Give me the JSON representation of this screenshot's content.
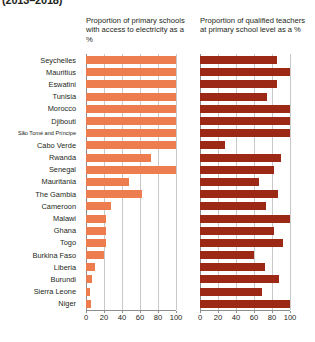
{
  "figure": {
    "title": "(2013–2018)"
  },
  "panels": {
    "left": {
      "header": "Proportion of primary schools with access to electricity as a %"
    },
    "right": {
      "header": "Proportion of qualified teachers at primary school level as a %"
    }
  },
  "axis": {
    "ticks": [
      "0",
      "20",
      "40",
      "60",
      "80",
      "100"
    ]
  },
  "colors": {
    "left_bar": "#ED7D4E",
    "right_bar": "#9B2915",
    "gridline": "#C9C9C9",
    "axis": "#8D8D8D",
    "text": "#231F20",
    "background": "#FFFFFF"
  },
  "chart_data": {
    "type": "bar",
    "orientation": "horizontal",
    "title": "(2013–2018)",
    "xlabel": "",
    "ylabel": "",
    "xlim": [
      0,
      100
    ],
    "grid": true,
    "legend": "none",
    "categories": [
      "Seychelles",
      "Mauritius",
      "Eswatini",
      "Tunisia",
      "Morocco",
      "Djibouti",
      "São Tomé and Príncipe",
      "Cabo Verde",
      "Rwanda",
      "Senegal",
      "Mauritania",
      "The Gambia",
      "Cameroon",
      "Malawi",
      "Ghana",
      "Togo",
      "Burkina Faso",
      "Liberia",
      "Burundi",
      "Sierra Leone",
      "Niger"
    ],
    "series": [
      {
        "name": "Proportion of primary schools with access to electricity as a %",
        "color": "#ED7D4E",
        "values": [
          100,
          100,
          100,
          100,
          100,
          100,
          100,
          100,
          72,
          100,
          48,
          62,
          28,
          22,
          22,
          22,
          20,
          10,
          7,
          4,
          5
        ]
      },
      {
        "name": "Proportion of qualified teachers at primary school level as a %",
        "color": "#9B2915",
        "values": [
          85,
          100,
          86,
          74,
          100,
          100,
          100,
          28,
          90,
          82,
          66,
          87,
          73,
          100,
          82,
          92,
          60,
          72,
          88,
          69,
          100
        ]
      }
    ]
  }
}
